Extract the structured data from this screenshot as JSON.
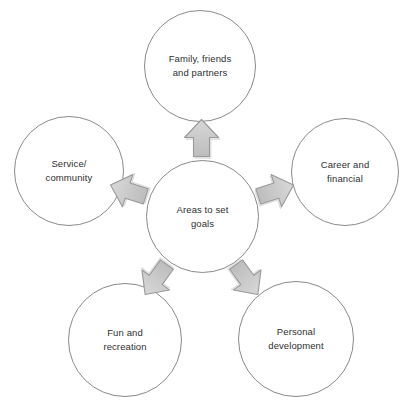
{
  "diagram": {
    "title": "Areas to set goals",
    "type": "radial-hub-and-spoke",
    "center": {
      "id": "center",
      "label": "Areas to set\ngoals"
    },
    "nodes": [
      {
        "id": "family",
        "label": "Family, friends\nand partners",
        "position": "top",
        "angle_deg": 0
      },
      {
        "id": "career",
        "label": "Career and\nfinancial",
        "position": "upper-right",
        "angle_deg": 72
      },
      {
        "id": "personal",
        "label": "Personal\ndevelopment",
        "position": "lower-right",
        "angle_deg": 144
      },
      {
        "id": "fun",
        "label": "Fun and\nrecreation",
        "position": "lower-left",
        "angle_deg": 216
      },
      {
        "id": "service",
        "label": "Service/\ncommunity",
        "position": "upper-left",
        "angle_deg": 288
      }
    ],
    "arrows": [
      {
        "id": "arrow-to-family",
        "target": "family",
        "angle_deg": 0,
        "direction": "up"
      },
      {
        "id": "arrow-to-career",
        "target": "career",
        "angle_deg": 72,
        "direction": "upper-right"
      },
      {
        "id": "arrow-to-personal",
        "target": "personal",
        "angle_deg": 144,
        "direction": "lower-right"
      },
      {
        "id": "arrow-to-fun",
        "target": "fun",
        "angle_deg": 216,
        "direction": "lower-left"
      },
      {
        "id": "arrow-to-service",
        "target": "service",
        "angle_deg": 288,
        "direction": "upper-left"
      }
    ],
    "colors": {
      "background": "#ffffff",
      "circle_fill": "#ffffff",
      "circle_stroke": "#8a8a8a",
      "arrow_fill": "#c9c9c9",
      "arrow_stroke": "#9a9a9a",
      "arrow_shadow": "#b0b0b0",
      "text": "#2f2f2f"
    }
  }
}
